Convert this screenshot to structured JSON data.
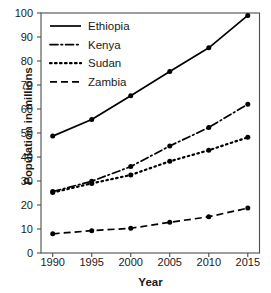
{
  "chart_data": {
    "type": "line",
    "title": "",
    "xlabel": "Year",
    "ylabel": "Population in millions",
    "x": [
      1990,
      1995,
      2000,
      2005,
      2010,
      2015
    ],
    "categories": [
      "1990",
      "1995",
      "2000",
      "2005",
      "2010",
      "2015"
    ],
    "xlim": [
      1988.5,
      2016.5
    ],
    "ylim": [
      0,
      100
    ],
    "yticks": [
      0,
      10,
      20,
      30,
      40,
      50,
      60,
      70,
      80,
      90,
      100
    ],
    "ytick_labels": [
      "0",
      "10",
      "20",
      "30",
      "40",
      "50",
      "60",
      "70",
      "80",
      "90",
      "100"
    ],
    "xticks": [
      1990,
      1995,
      2000,
      2005,
      2010,
      2015
    ],
    "xtick_labels": [
      "1990",
      "1995",
      "2000",
      "2005",
      "2010",
      "2015"
    ],
    "grid": false,
    "legend_position": "upper left",
    "frame": true,
    "tick_direction": "out",
    "marker": "circle",
    "series": [
      {
        "name": "Ethiopia",
        "line_style": "solid",
        "color": "#000000",
        "values": [
          48.7,
          55.6,
          65.5,
          75.6,
          85.5,
          99.0
        ]
      },
      {
        "name": "Kenya",
        "line_style": "dashdot",
        "color": "#000000",
        "values": [
          25.6,
          29.9,
          36.0,
          44.6,
          52.3,
          62.0
        ]
      },
      {
        "name": "Sudan",
        "line_style": "dotted",
        "color": "#000000",
        "values": [
          25.2,
          29.0,
          32.5,
          38.2,
          42.8,
          48.2
        ]
      },
      {
        "name": "Zambia",
        "line_style": "dashed",
        "color": "#000000",
        "values": [
          8.0,
          9.3,
          10.3,
          12.8,
          15.1,
          18.7
        ]
      }
    ]
  },
  "legend": {
    "items": [
      {
        "label": "Ethiopia"
      },
      {
        "label": "Kenya"
      },
      {
        "label": "Sudan"
      },
      {
        "label": "Zambia"
      }
    ]
  },
  "colors": {
    "ink": "#1a1a1a",
    "line": "#000000",
    "frame": "#4d4d4d",
    "background": "#ffffff"
  }
}
